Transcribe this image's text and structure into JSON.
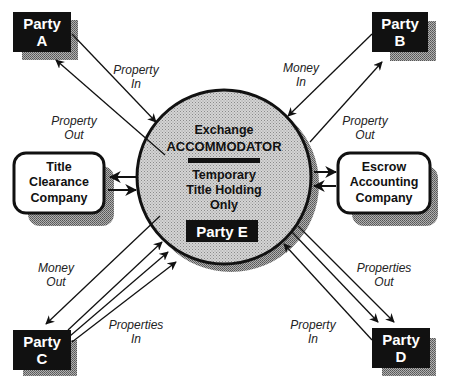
{
  "diagram": {
    "center": {
      "line1": "Exchange",
      "line2": "ACCOMMODATOR",
      "line3": "Temporary",
      "line4": "Title Holding",
      "line5": "Only",
      "party_label": "Party E"
    },
    "parties": {
      "a": {
        "line1": "Party",
        "line2": "A"
      },
      "b": {
        "line1": "Party",
        "line2": "B"
      },
      "c": {
        "line1": "Party",
        "line2": "C"
      },
      "d": {
        "line1": "Party",
        "line2": "D"
      }
    },
    "title_clearance": {
      "line1": "Title",
      "line2": "Clearance",
      "line3": "Company"
    },
    "escrow": {
      "line1": "Escrow",
      "line2": "Accounting",
      "line3": "Company"
    },
    "flow_labels": {
      "a_property_in": {
        "line1": "Property",
        "line2": "In"
      },
      "a_property_out": {
        "line1": "Property",
        "line2": "Out"
      },
      "b_money_in": {
        "line1": "Money",
        "line2": "In"
      },
      "b_property_out": {
        "line1": "Property",
        "line2": "Out"
      },
      "c_money_out": {
        "line1": "Money",
        "line2": "Out"
      },
      "c_properties_in": {
        "line1": "Properties",
        "line2": "In"
      },
      "d_properties_out": {
        "line1": "Properties",
        "line2": "Out"
      },
      "d_property_in": {
        "line1": "Property",
        "line2": "In"
      }
    },
    "colors": {
      "party_fill": "#111111",
      "shadow": "#9a9a9a",
      "circle_fill": "#c8c8c8",
      "stroke": "#111111",
      "background": "#ffffff"
    }
  }
}
